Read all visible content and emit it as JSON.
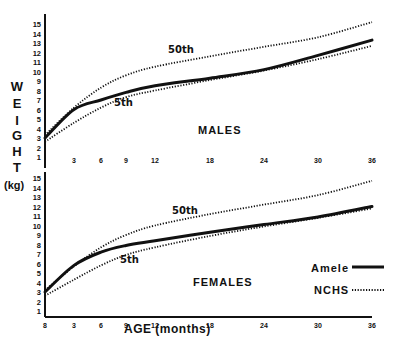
{
  "chart_data": [
    {
      "type": "line",
      "title": "MALES",
      "xlabel": "AGE (months)",
      "ylabel": "WEIGHT (kg)",
      "x": [
        0,
        3,
        6,
        9,
        12,
        18,
        24,
        30,
        36
      ],
      "x_ticks": [
        "3",
        "6",
        "9",
        "12",
        "18",
        "24",
        "30",
        "36"
      ],
      "y_ticks": [
        1,
        2,
        3,
        4,
        5,
        6,
        7,
        8,
        9,
        10,
        11,
        12,
        13,
        14,
        15
      ],
      "ylim": [
        1,
        15
      ],
      "xlim": [
        0,
        36
      ],
      "series": [
        {
          "name": "Amele",
          "style": "solid",
          "values": [
            3.0,
            6.0,
            7.0,
            7.8,
            8.5,
            9.3,
            10.2,
            11.7,
            13.3
          ]
        },
        {
          "name": "NCHS 50th",
          "style": "dotted",
          "values": [
            3.3,
            6.2,
            8.3,
            9.6,
            10.5,
            11.6,
            12.6,
            13.6,
            15.2
          ]
        },
        {
          "name": "NCHS 5th",
          "style": "dotted",
          "values": [
            2.6,
            4.6,
            6.2,
            7.3,
            8.0,
            9.1,
            10.1,
            11.3,
            12.7
          ]
        }
      ],
      "annotations": [
        "50th",
        "5th"
      ]
    },
    {
      "type": "line",
      "title": "FEMALES",
      "xlabel": "AGE (months)",
      "ylabel": "WEIGHT (kg)",
      "x": [
        0,
        3,
        6,
        9,
        12,
        18,
        24,
        30,
        36
      ],
      "x_ticks": [
        "0",
        "3",
        "6",
        "9",
        "12",
        "18",
        "24",
        "30",
        "36"
      ],
      "y_ticks": [
        1,
        2,
        3,
        4,
        5,
        6,
        7,
        8,
        9,
        10,
        11,
        12,
        13,
        14,
        15
      ],
      "ylim": [
        1,
        15
      ],
      "xlim": [
        0,
        36
      ],
      "series": [
        {
          "name": "Amele",
          "style": "solid",
          "values": [
            3.0,
            5.8,
            7.2,
            7.9,
            8.4,
            9.3,
            10.1,
            10.9,
            12.0
          ]
        },
        {
          "name": "NCHS 50th",
          "style": "dotted",
          "values": [
            3.2,
            5.7,
            7.7,
            9.0,
            10.0,
            11.2,
            12.2,
            13.2,
            14.7
          ]
        },
        {
          "name": "NCHS 5th",
          "style": "dotted",
          "values": [
            2.6,
            4.3,
            5.8,
            6.9,
            7.7,
            8.9,
            9.9,
            10.8,
            11.8
          ]
        }
      ],
      "annotations": [
        "50th",
        "5th"
      ],
      "legend": [
        {
          "label": "Amele",
          "style": "solid"
        },
        {
          "label": "NCHS",
          "style": "dotted"
        }
      ]
    }
  ],
  "labels": {
    "ylabel_letters": [
      "W",
      "E",
      "I",
      "G",
      "H",
      "T"
    ],
    "ylabel_unit": "(kg)",
    "males": "MALES",
    "females": "FEMALES",
    "xlabel": "AGE (months)",
    "p50": "50th",
    "p5": "5th",
    "legend_amele": "Amele",
    "legend_nchs": "NCHS"
  }
}
